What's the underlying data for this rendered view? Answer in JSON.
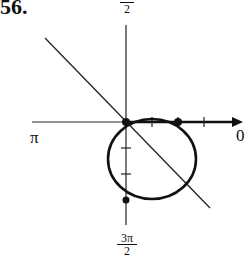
{
  "problem_number": "56.",
  "axis_labels": {
    "top": {
      "numerator": "π",
      "denominator": "2"
    },
    "left": "π",
    "right": "0",
    "bottom": {
      "numerator": "3π",
      "denominator": "2"
    }
  },
  "figure": {
    "colors": {
      "stroke": "#111111",
      "background": "#ffffff"
    },
    "curves": [
      {
        "type": "circle",
        "label": "circle through the pole"
      },
      {
        "type": "line",
        "label": "line through the pole (θ = 3π/4)"
      }
    ],
    "marked_points": [
      {
        "name": "pole"
      },
      {
        "name": "point on polar axis"
      },
      {
        "name": "point on 3π/2 axis"
      }
    ]
  }
}
